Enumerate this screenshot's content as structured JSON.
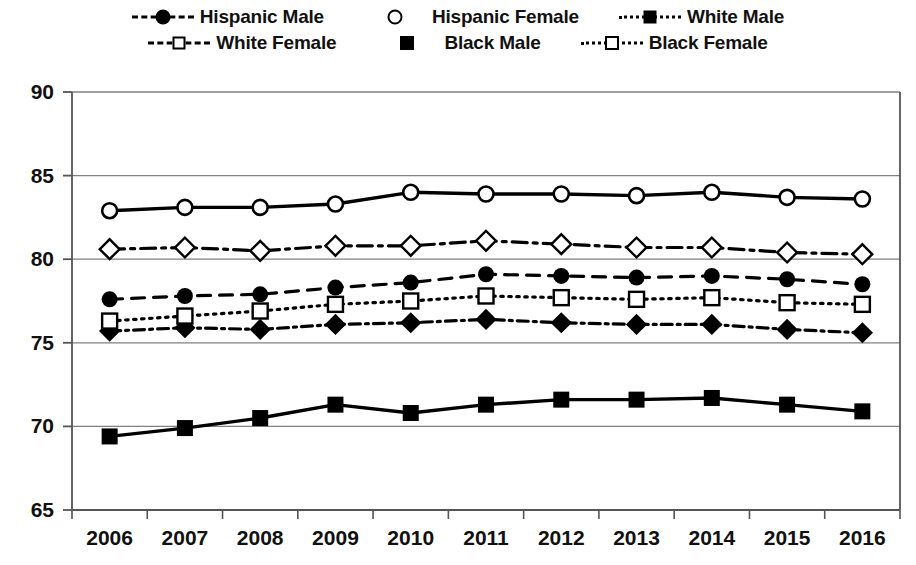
{
  "chart_data": {
    "type": "line",
    "title": "",
    "xlabel": "",
    "ylabel": "",
    "categories": [
      "2006",
      "2007",
      "2008",
      "2009",
      "2010",
      "2011",
      "2012",
      "2013",
      "2014",
      "2015",
      "2016"
    ],
    "x": [
      2006,
      2007,
      2008,
      2009,
      2010,
      2011,
      2012,
      2013,
      2014,
      2015,
      2016
    ],
    "ylim": [
      65,
      90
    ],
    "yticks": [
      65,
      70,
      75,
      80,
      85,
      90
    ],
    "ytick_labels": [
      "65",
      "70",
      "75",
      "80",
      "85",
      "90"
    ],
    "grid": "horizontal",
    "legend_position": "top",
    "series": [
      {
        "name": "Hispanic Male",
        "marker": "circle-filled",
        "line_style": "dashed",
        "values": [
          77.6,
          77.8,
          77.9,
          78.3,
          78.6,
          79.1,
          79.0,
          78.9,
          79.0,
          78.8,
          78.5
        ]
      },
      {
        "name": "Hispanic Female",
        "marker": "circle-open",
        "line_style": "solid",
        "values": [
          82.9,
          83.1,
          83.1,
          83.3,
          84.0,
          83.9,
          83.9,
          83.8,
          84.0,
          83.7,
          83.6
        ]
      },
      {
        "name": "White Male",
        "marker": "diamond-filled",
        "line_style": "dash-dot-tight",
        "values": [
          75.7,
          75.9,
          75.8,
          76.1,
          76.2,
          76.4,
          76.2,
          76.1,
          76.1,
          75.8,
          75.6
        ]
      },
      {
        "name": "White Female",
        "marker": "diamond-open",
        "line_style": "dash-dot",
        "values": [
          80.6,
          80.7,
          80.5,
          80.8,
          80.8,
          81.1,
          80.9,
          80.7,
          80.7,
          80.4,
          80.3
        ]
      },
      {
        "name": "Black Male",
        "marker": "square-filled",
        "line_style": "solid",
        "values": [
          69.4,
          69.9,
          70.5,
          71.3,
          70.8,
          71.3,
          71.6,
          71.6,
          71.7,
          71.3,
          70.9
        ]
      },
      {
        "name": "Black Female",
        "marker": "square-open",
        "line_style": "dotted",
        "values": [
          76.3,
          76.6,
          76.9,
          77.3,
          77.5,
          77.8,
          77.7,
          77.6,
          77.7,
          77.4,
          77.3
        ]
      }
    ]
  },
  "legend": {
    "items": [
      {
        "label": "Hispanic Male",
        "marker": "circle-filled",
        "style": "dashed"
      },
      {
        "label": "Hispanic Female",
        "marker": "circle-open",
        "style": "solid"
      },
      {
        "label": "White Male",
        "marker": "diamond-filled",
        "style": "dash-dot-tight"
      },
      {
        "label": "White Female",
        "marker": "diamond-open",
        "style": "dash-dot"
      },
      {
        "label": "Black Male",
        "marker": "square-filled",
        "style": "solid"
      },
      {
        "label": "Black Female",
        "marker": "square-open",
        "style": "dotted"
      }
    ]
  },
  "colors": {
    "series": "#000000",
    "grid": "#808080",
    "axis": "#555555",
    "background": "#ffffff",
    "text": "#111111"
  }
}
